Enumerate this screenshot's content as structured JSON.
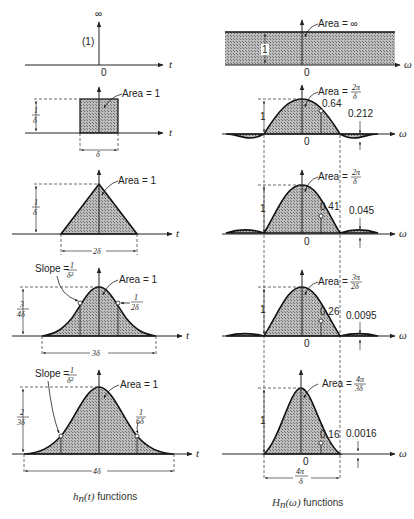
{
  "figure": {
    "left_column_caption": "h_n(t) functions",
    "right_column_caption": "H_n(ω) functions",
    "left_caption_parts": {
      "sym": "h",
      "sub": "n",
      "arg": "(t)",
      "rest": " functions"
    },
    "right_caption_parts": {
      "sym": "H",
      "sub": "n",
      "arg": "(ω)",
      "rest": " functions"
    }
  },
  "left_panels": [
    {
      "id": "impulse",
      "top_label": "∞",
      "weight_label": "(1)",
      "origin": "0",
      "axis": "t"
    },
    {
      "id": "rect",
      "area": "Area = 1",
      "height": {
        "num": "1",
        "den": "δ"
      },
      "width": "δ",
      "axis": "t"
    },
    {
      "id": "triangle",
      "area": "Area = 1",
      "height": {
        "num": "1",
        "den": "δ"
      },
      "width": "2δ",
      "axis": "t"
    },
    {
      "id": "quadratic",
      "area": "Area = 1",
      "slope_label": "Slope = ",
      "slope": {
        "num": "1",
        "den": "δ²"
      },
      "point": {
        "num": "1",
        "den": "2δ"
      },
      "height": {
        "num": "3",
        "den": "4δ"
      },
      "width": "3δ",
      "axis": "t"
    },
    {
      "id": "cubic",
      "area": "Area = 1",
      "slope_label": "Slope = ",
      "slope": {
        "num": "1",
        "den": "δ²"
      },
      "point": {
        "num": "1",
        "den": "6δ"
      },
      "height": {
        "num": "2",
        "den": "3δ"
      },
      "width": "4δ",
      "axis": "t"
    }
  ],
  "right_panels": [
    {
      "id": "flat",
      "area": "Area = ∞",
      "height": "1",
      "origin": "0",
      "axis": "ω"
    },
    {
      "id": "sinc",
      "area": "Area = ",
      "area_frac": {
        "num": "2π",
        "den": "δ"
      },
      "height": "1",
      "marker": "0.64",
      "sidelobe": "0.212",
      "origin": "0",
      "axis": "ω"
    },
    {
      "id": "sinc2",
      "area": "Area = ",
      "area_frac": {
        "num": "2π",
        "den": "δ"
      },
      "height": "1",
      "marker": "0.41",
      "sidelobe": "0.045",
      "origin": "0",
      "axis": "ω"
    },
    {
      "id": "sinc3",
      "area": "Area = ",
      "area_frac": {
        "num": "3π",
        "den": "2δ"
      },
      "height": "1",
      "marker": "0.26",
      "sidelobe": "0.0095",
      "origin": "0",
      "axis": "ω"
    },
    {
      "id": "sinc4",
      "area": "Area = ",
      "area_frac": {
        "num": "4π",
        "den": "3δ"
      },
      "height": "1",
      "marker": "0.16",
      "sidelobe": "0.0016",
      "origin": "0",
      "axis": "ω",
      "bottom_width": {
        "num": "4π",
        "den": "δ"
      }
    }
  ],
  "colors": {
    "ink": "#222222",
    "hatch": "#8a8a8a",
    "background": "#ffffff"
  }
}
